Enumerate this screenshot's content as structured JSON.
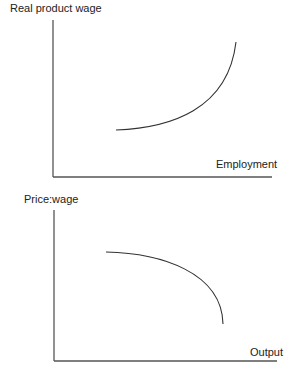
{
  "diagram": {
    "panels": [
      {
        "id": "top",
        "y_label": "Real product wage",
        "x_label": "Employment",
        "curve": "upward-sloping convex curve (real product wage rises increasingly with employment)"
      },
      {
        "id": "bottom",
        "y_label": "Price:wage",
        "x_label": "Output",
        "curve": "downward-sloping concave curve (price:wage falls increasingly with output)"
      }
    ],
    "colors": {
      "axis": "#555555",
      "curve": "#333333",
      "text": "#222222"
    }
  }
}
